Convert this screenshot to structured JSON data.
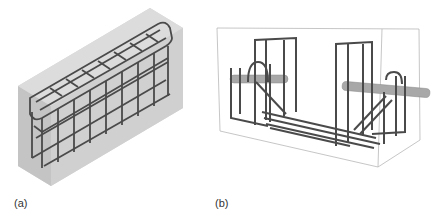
{
  "figure": {
    "panels": [
      {
        "id": "a",
        "label": "(a)",
        "description": "Rebar cage embedded in translucent concrete block, isometric view"
      },
      {
        "id": "b",
        "label": "(b)",
        "description": "Reinforcement with two transverse bars/pins in transparent box outline"
      }
    ],
    "colors": {
      "concrete": "#d4d4d4",
      "concrete_side": "#c2c2c2",
      "rebar": "#4a4a4a",
      "pin": "#a8a8a8",
      "outline": "#b8b8b8"
    }
  }
}
